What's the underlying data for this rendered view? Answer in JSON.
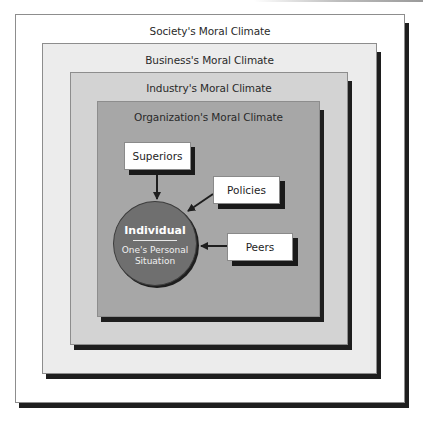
{
  "diagram": {
    "type": "nested-layers",
    "layers": [
      {
        "id": "society",
        "label": "Society's Moral Climate",
        "fill": "#ffffff"
      },
      {
        "id": "business",
        "label": "Business's Moral Climate",
        "fill": "#ececec"
      },
      {
        "id": "industry",
        "label": "Industry's Moral Climate",
        "fill": "#d3d3d3"
      },
      {
        "id": "organization",
        "label": "Organization's Moral Climate",
        "fill": "#a7a7a7"
      }
    ],
    "center": {
      "title": "Individual",
      "subtitle": "One's Personal Situation",
      "fill": "#6f6f6f"
    },
    "influences": [
      {
        "label": "Superiors",
        "target": "Individual"
      },
      {
        "label": "Policies",
        "target": "Individual"
      },
      {
        "label": "Peers",
        "target": "Individual"
      }
    ],
    "shadow_color": "#1e1e1e"
  }
}
